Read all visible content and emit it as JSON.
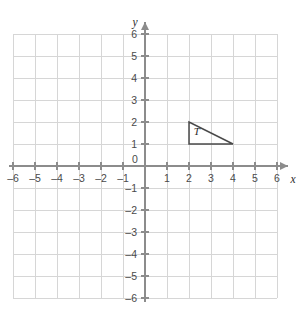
{
  "chart_data": {
    "type": "scatter",
    "title": "",
    "xlabel": "x",
    "ylabel": "y",
    "xlim": [
      -6,
      6
    ],
    "ylim": [
      -6,
      6
    ],
    "grid": true,
    "legend": "none",
    "x_ticks": [
      -6,
      -5,
      -4,
      -3,
      -2,
      -1,
      0,
      1,
      2,
      3,
      4,
      5,
      6
    ],
    "y_ticks": [
      -6,
      -5,
      -4,
      -3,
      -2,
      -1,
      1,
      2,
      3,
      4,
      5,
      6
    ],
    "x_tick_labels": [
      "–6",
      "–5",
      "–4",
      "–3",
      "–2",
      "–1",
      "0",
      "1",
      "2",
      "3",
      "4",
      "5",
      "6"
    ],
    "y_tick_labels": [
      "–6",
      "–5",
      "–4",
      "–3",
      "–2",
      "–1",
      "1",
      "2",
      "3",
      "4",
      "5",
      "6"
    ],
    "origin_label": "0",
    "shapes": [
      {
        "name": "triangle-t",
        "label": "T",
        "kind": "polygon",
        "vertices": [
          [
            2,
            2
          ],
          [
            2,
            1
          ],
          [
            4,
            1
          ]
        ],
        "label_position": [
          2.35,
          1.42
        ],
        "stroke": "#4a4a4a",
        "fill": "none"
      }
    ]
  },
  "axes": {
    "x_name": "x",
    "y_name": "y",
    "axis_color": "#8c8c8c",
    "grid_color": "#d6d6d6"
  }
}
